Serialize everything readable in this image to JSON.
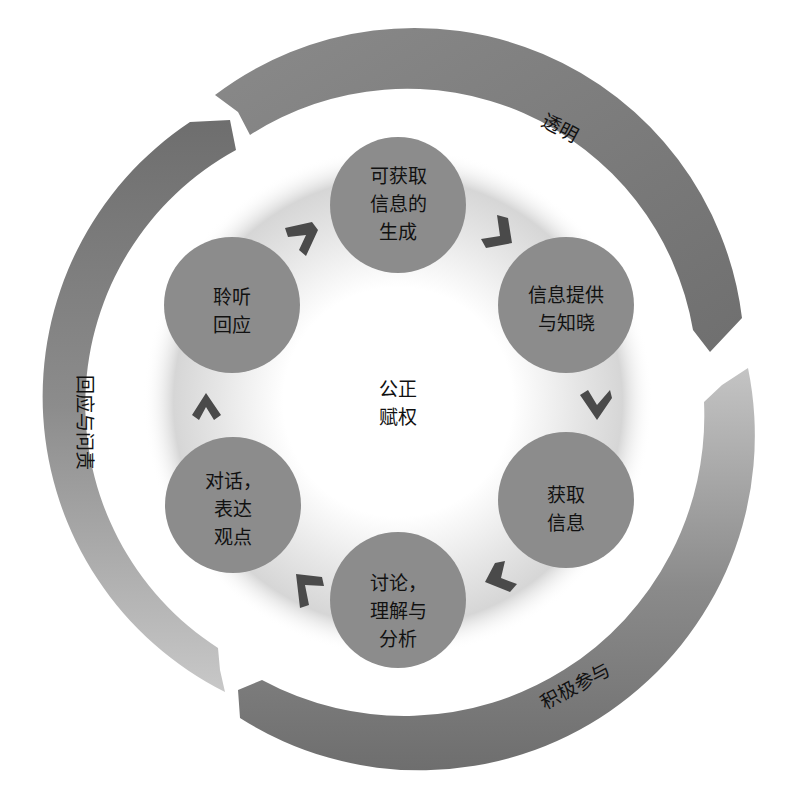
{
  "diagram": {
    "type": "cycle",
    "center": {
      "lines": [
        "公正",
        "赋权"
      ]
    },
    "nodes": [
      {
        "id": "top",
        "lines": [
          "可获取",
          "信息的",
          "生成"
        ]
      },
      {
        "id": "upper-right",
        "lines": [
          "信息提供",
          "与知晓"
        ]
      },
      {
        "id": "lower-right",
        "lines": [
          "获取",
          "信息"
        ]
      },
      {
        "id": "bottom",
        "lines": [
          "讨论，",
          "理解与",
          "分析"
        ]
      },
      {
        "id": "lower-left",
        "lines": [
          "对话，",
          "表达",
          "观点"
        ]
      },
      {
        "id": "upper-left",
        "lines": [
          "聆听",
          "回应"
        ]
      }
    ],
    "outer_arcs": [
      {
        "id": "transparency",
        "label": "透明"
      },
      {
        "id": "active-participation",
        "label": "积极参与"
      },
      {
        "id": "response-accountability",
        "label": "回应与问责"
      }
    ],
    "flow_direction": "clockwise"
  },
  "colors": {
    "background": "#ffffff",
    "node_fill": "#8c8c8c",
    "arc_dark": "#7a7a7a",
    "arc_light": "#bdbdbd",
    "chevron": "#4a4a4a",
    "text": "#111111"
  }
}
